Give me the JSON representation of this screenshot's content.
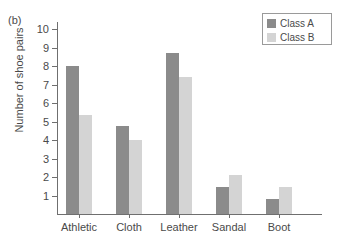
{
  "panel": {
    "label": "(b)"
  },
  "chart_data": {
    "type": "bar",
    "title": "",
    "xlabel": "",
    "ylabel": "Number of shoe pairs",
    "categories": [
      "Athletic",
      "Cloth",
      "Leather",
      "Sandal",
      "Boot"
    ],
    "series": [
      {
        "name": "Class A",
        "color": "#8b8b8b",
        "values": [
          8.0,
          4.75,
          8.7,
          1.45,
          0.8
        ]
      },
      {
        "name": "Class B",
        "color": "#d4d4d4",
        "values": [
          5.35,
          4.0,
          7.4,
          2.1,
          1.45
        ]
      }
    ],
    "ylim": [
      0,
      10.4
    ],
    "yticks": [
      1,
      2,
      3,
      4,
      5,
      6,
      7,
      8,
      9,
      10
    ],
    "ytick_labels": [
      "1",
      "2",
      "3",
      "4",
      "5",
      "6",
      "7",
      "8",
      "9",
      "10"
    ],
    "grid": false,
    "legend_position": "top-right",
    "legend_entries": [
      "Class A",
      "Class B"
    ]
  }
}
